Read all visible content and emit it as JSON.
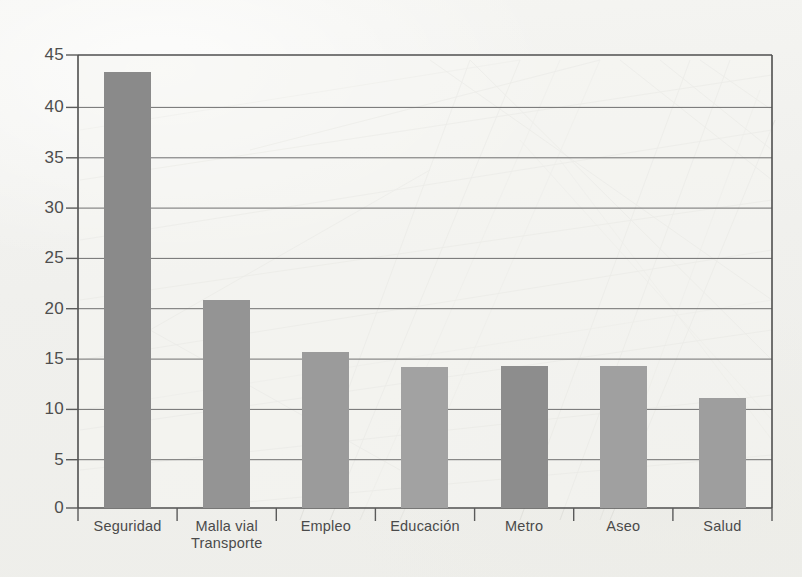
{
  "chart_data": {
    "type": "bar",
    "title": "",
    "subtitle": "",
    "xlabel": "",
    "ylabel": "",
    "categories": [
      "Seguridad",
      "Malla vial Transporte",
      "Empleo",
      "Educación",
      "Metro",
      "Aseo",
      "Salud"
    ],
    "category_lines": [
      [
        "Seguridad"
      ],
      [
        "Malla vial",
        "Transporte"
      ],
      [
        "Empleo"
      ],
      [
        "Educación"
      ],
      [
        "Metro"
      ],
      [
        "Aseo"
      ],
      [
        "Salud"
      ]
    ],
    "values": [
      43.3,
      20.7,
      15.5,
      14.0,
      14.1,
      14.1,
      10.9
    ],
    "bar_colors": [
      "#8a8a8a",
      "#949494",
      "#9b9b9b",
      "#a2a2a2",
      "#8d8d8d",
      "#a0a0a0",
      "#9e9e9e"
    ],
    "ylim": [
      0,
      45
    ],
    "yticks": [
      0,
      5,
      10,
      15,
      20,
      25,
      30,
      35,
      40,
      45
    ],
    "ytick_labels": [
      "0",
      "5",
      "10",
      "15",
      "20",
      "25",
      "30",
      "35",
      "40",
      "45"
    ],
    "grid": true,
    "grid_axis": "y",
    "legend": false,
    "legend_position": "none",
    "annotations": [],
    "axis_color": "#5a5a5a",
    "grid_color": "#6f6f6f",
    "plot_background": "#f4f4f1",
    "page_background": "#f1f1ee"
  }
}
